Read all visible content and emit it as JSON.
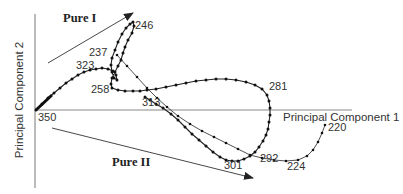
{
  "chart_data": {
    "type": "scatter",
    "title": "",
    "xlabel": "Principal Component 1",
    "ylabel": "Principal Component 2",
    "grid": false,
    "legend": null,
    "annotations": [
      {
        "text": "Pure I",
        "type": "arrow",
        "direction": "up-right",
        "from": [
          48,
          63
        ],
        "to": [
          133,
          13
        ]
      },
      {
        "text": "Pure II",
        "type": "arrow",
        "direction": "down-right",
        "from": [
          52,
          128
        ],
        "to": [
          252,
          178
        ]
      }
    ],
    "point_labels": [
      {
        "text": "246",
        "x": 135,
        "y": 20
      },
      {
        "text": "237",
        "x": 89,
        "y": 47
      },
      {
        "text": "323",
        "x": 76,
        "y": 60
      },
      {
        "text": "258",
        "x": 91,
        "y": 84
      },
      {
        "text": "313",
        "x": 142,
        "y": 97
      },
      {
        "text": "281",
        "x": 269,
        "y": 81
      },
      {
        "text": "350",
        "x": 38,
        "y": 112
      },
      {
        "text": "301",
        "x": 224,
        "y": 160
      },
      {
        "text": "292",
        "x": 260,
        "y": 153
      },
      {
        "text": "224",
        "x": 287,
        "y": 161
      },
      {
        "text": "220",
        "x": 328,
        "y": 122
      }
    ],
    "series": [
      {
        "name": "trajectory",
        "description": "Wavelength trajectory (approx. 350 to 220 nm) in PC space, pixel coordinates",
        "points": [
          [
            36,
            110
          ],
          [
            42,
            104
          ],
          [
            48,
            98
          ],
          [
            54,
            93
          ],
          [
            60,
            88
          ],
          [
            66,
            83
          ],
          [
            72,
            79
          ],
          [
            78,
            75
          ],
          [
            84,
            72
          ],
          [
            90,
            70
          ],
          [
            96,
            69
          ],
          [
            102,
            68
          ],
          [
            108,
            69
          ],
          [
            113,
            71
          ],
          [
            116,
            75
          ],
          [
            117,
            80
          ],
          [
            114,
            78
          ],
          [
            112,
            72
          ],
          [
            111,
            65
          ],
          [
            112,
            58
          ],
          [
            115,
            50
          ],
          [
            118,
            42
          ],
          [
            122,
            34
          ],
          [
            126,
            28
          ],
          [
            130,
            24
          ],
          [
            133,
            22
          ],
          [
            134,
            26
          ],
          [
            132,
            33
          ],
          [
            128,
            40
          ],
          [
            125,
            47
          ],
          [
            123,
            53
          ],
          [
            121,
            60
          ],
          [
            118,
            66
          ],
          [
            115,
            72
          ],
          [
            112,
            78
          ],
          [
            111,
            84
          ],
          [
            112,
            88
          ],
          [
            118,
            90
          ],
          [
            125,
            91
          ],
          [
            133,
            91
          ],
          [
            140,
            91
          ],
          [
            147,
            90
          ],
          [
            156,
            89
          ],
          [
            166,
            87
          ],
          [
            176,
            85
          ],
          [
            186,
            83
          ],
          [
            196,
            81
          ],
          [
            206,
            80
          ],
          [
            216,
            79
          ],
          [
            226,
            79
          ],
          [
            236,
            80
          ],
          [
            246,
            82
          ],
          [
            255,
            85
          ],
          [
            262,
            89
          ],
          [
            267,
            95
          ],
          [
            269,
            101
          ],
          [
            270,
            108
          ],
          [
            270,
            115
          ],
          [
            269,
            122
          ],
          [
            268,
            129
          ],
          [
            266,
            135
          ],
          [
            263,
            141
          ],
          [
            259,
            147
          ],
          [
            255,
            152
          ],
          [
            250,
            156
          ],
          [
            244,
            159
          ],
          [
            238,
            161
          ],
          [
            232,
            161
          ],
          [
            226,
            160
          ],
          [
            220,
            157
          ],
          [
            213,
            152
          ],
          [
            206,
            146
          ],
          [
            199,
            140
          ],
          [
            192,
            134
          ],
          [
            185,
            127
          ],
          [
            178,
            120
          ],
          [
            171,
            114
          ],
          [
            163,
            108
          ],
          [
            156,
            104
          ],
          [
            150,
            100
          ],
          [
            145,
            97
          ]
        ]
      },
      {
        "name": "trajectory-tail",
        "description": "Secondary branch: from crossing near 237 down to 220",
        "points": [
          [
            117,
            55
          ],
          [
            127,
            66
          ],
          [
            137,
            77
          ],
          [
            147,
            88
          ],
          [
            157,
            98
          ],
          [
            167,
            107
          ],
          [
            178,
            116
          ],
          [
            190,
            124
          ],
          [
            202,
            131
          ],
          [
            214,
            137
          ],
          [
            226,
            143
          ],
          [
            238,
            149
          ],
          [
            250,
            155
          ],
          [
            262,
            158
          ],
          [
            274,
            160
          ],
          [
            286,
            161
          ],
          [
            298,
            160
          ],
          [
            307,
            156
          ],
          [
            313,
            150
          ],
          [
            318,
            142
          ],
          [
            322,
            133
          ],
          [
            325,
            125
          ]
        ]
      }
    ],
    "axes": {
      "y_axis": {
        "x": 35,
        "y_top": 14,
        "y_bottom": 188
      },
      "x_axis": {
        "y": 110,
        "x_left": 35,
        "x_right": 352
      }
    }
  },
  "labels": {
    "xlabel": "Principal Component 1",
    "ylabel": "Principal Component 2",
    "pure1": "Pure I",
    "pure2": "Pure II",
    "p246": "246",
    "p237": "237",
    "p323": "323",
    "p258": "258",
    "p313": "313",
    "p281": "281",
    "p350": "350",
    "p301": "301",
    "p292": "292",
    "p224": "224",
    "p220": "220"
  },
  "colors": {
    "axis": "#777777",
    "curve": "#222222",
    "marker": "#111111",
    "arrow": "#333333",
    "text": "#333333"
  }
}
